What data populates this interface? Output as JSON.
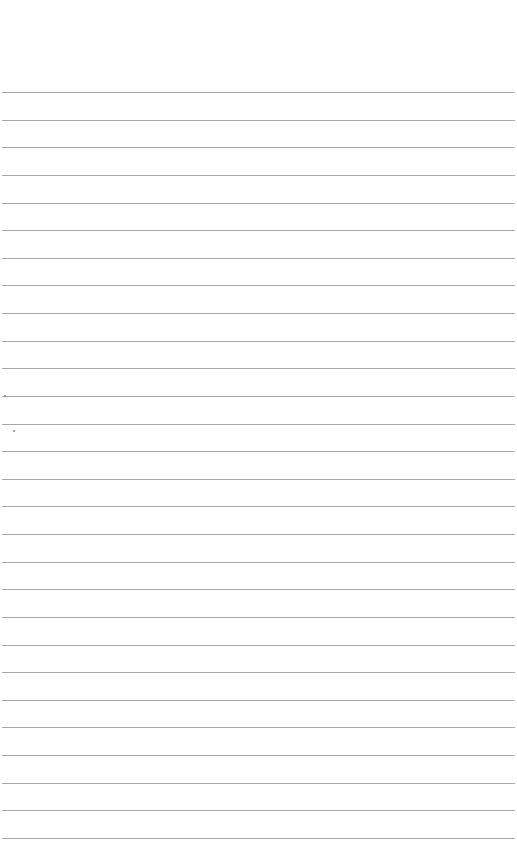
{
  "page": {
    "type": "lined-paper",
    "background_color": "#ffffff",
    "rule_color": "#9a9a9a",
    "first_rule_y": 92,
    "rule_spacing": 27.63,
    "rule_count": 28
  }
}
